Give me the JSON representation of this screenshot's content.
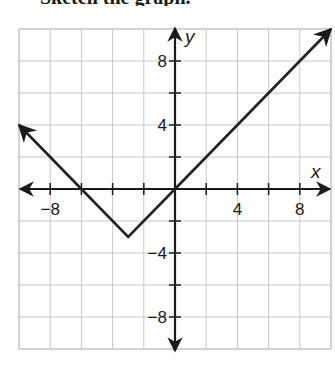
{
  "header": {
    "clipped_text": "Sketch the graph."
  },
  "chart_data": {
    "type": "line",
    "title": "",
    "xlabel": "x",
    "ylabel": "y",
    "xlim": [
      -10,
      10
    ],
    "ylim": [
      -10,
      10
    ],
    "grid": true,
    "grid_step": 2,
    "x_ticks": [
      -8,
      4,
      8
    ],
    "y_ticks": [
      8,
      4,
      -4,
      -8
    ],
    "x_tick_labels": [
      "−8",
      "4",
      "8"
    ],
    "y_tick_labels": [
      "8",
      "4",
      "−4",
      "−8"
    ],
    "series": [
      {
        "name": "piecewise V-shaped graph",
        "points": [
          [
            -10,
            4
          ],
          [
            -6,
            0
          ],
          [
            -3,
            -3
          ],
          [
            0,
            0
          ],
          [
            10,
            10
          ]
        ],
        "vertex": [
          -3,
          -3
        ],
        "x_intercepts": [
          -6,
          0
        ],
        "arrows_at_ends": true
      }
    ],
    "colors": {
      "line": "#222222",
      "grid": "#c8c8c8",
      "axis": "#1a1a1a"
    }
  }
}
